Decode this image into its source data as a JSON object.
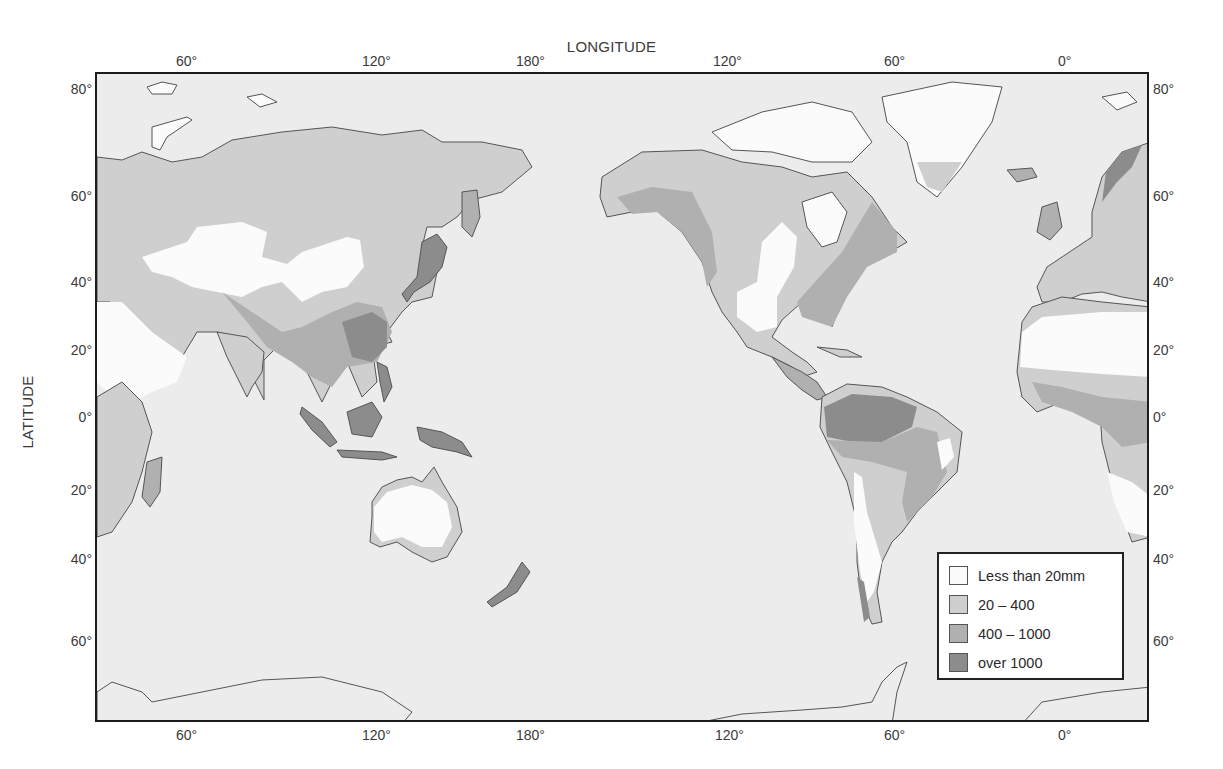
{
  "map": {
    "title_top": "LONGITUDE",
    "title_left": "LATITUDE",
    "top_ticks": [
      {
        "label": "60°",
        "x": 190
      },
      {
        "label": "120°",
        "x": 376
      },
      {
        "label": "180°",
        "x": 530
      },
      {
        "label": "120°",
        "x": 727
      },
      {
        "label": "60°",
        "x": 898
      },
      {
        "label": "0°",
        "x": 1072
      }
    ],
    "bottom_ticks": [
      {
        "label": "60°",
        "x": 190
      },
      {
        "label": "120°",
        "x": 376
      },
      {
        "label": "180°",
        "x": 530
      },
      {
        "label": "120°",
        "x": 729
      },
      {
        "label": "60°",
        "x": 898
      },
      {
        "label": "0°",
        "x": 1072
      }
    ],
    "left_ticks": [
      {
        "label": "80°",
        "y": 89
      },
      {
        "label": "60°",
        "y": 196
      },
      {
        "label": "40°",
        "y": 282
      },
      {
        "label": "20°",
        "y": 350
      },
      {
        "label": "0°",
        "y": 417
      },
      {
        "label": "20°",
        "y": 490
      },
      {
        "label": "40°",
        "y": 559
      },
      {
        "label": "60°",
        "y": 641
      }
    ],
    "right_ticks": [
      {
        "label": "80°",
        "y": 89
      },
      {
        "label": "60°",
        "y": 196
      },
      {
        "label": "40°",
        "y": 282
      },
      {
        "label": "20°",
        "y": 350
      },
      {
        "label": "0°",
        "y": 417
      },
      {
        "label": "20°",
        "y": 490
      },
      {
        "label": "40°",
        "y": 559
      },
      {
        "label": "60°",
        "y": 641
      }
    ],
    "colors": {
      "ocean": "#ececec",
      "less_than_20": "#fbfbfb",
      "c20_400": "#cfcfcf",
      "c400_1000": "#b0b0b0",
      "over_1000": "#8c8c8c",
      "coast": "#555555"
    }
  },
  "legend": {
    "items": [
      {
        "label": "Less than 20mm",
        "color": "#fbfbfb"
      },
      {
        "label": "20 – 400",
        "color": "#cfcfcf"
      },
      {
        "label": "400 – 1000",
        "color": "#b0b0b0"
      },
      {
        "label": "over 1000",
        "color": "#8c8c8c"
      }
    ]
  }
}
